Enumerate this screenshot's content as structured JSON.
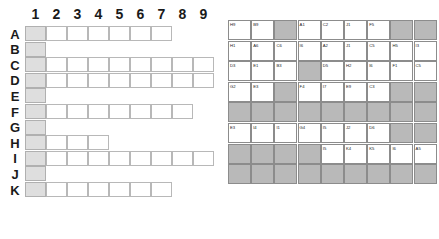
{
  "left_grid": {
    "name": "irregular-column-grid",
    "column_headers": [
      "1",
      "2",
      "3",
      "4",
      "5",
      "6",
      "7",
      "8",
      "9"
    ],
    "row_headers": [
      "A",
      "B",
      "C",
      "D",
      "E",
      "F",
      "G",
      "H",
      "I",
      "J",
      "K"
    ],
    "shaded_column": 1,
    "row_extents": {
      "A": 7,
      "B": 1,
      "C": 9,
      "D": 9,
      "E": 1,
      "F": 8,
      "G": 1,
      "H": 4,
      "I": 9,
      "J": 1,
      "K": 7
    },
    "colors": {
      "shaded_cell": "#dedede",
      "cell_border": "#b8b8b8",
      "header_text": "#1a1a1a"
    }
  },
  "right_table": {
    "name": "label-code-matrix",
    "columns": 9,
    "rows": 8,
    "colors": {
      "filled_cell": "#b9b9b9",
      "empty_cell": "#ffffff",
      "cell_border": "#8c8c8c",
      "label_text": "#222222"
    },
    "cells": [
      [
        "H9",
        "B9",
        "",
        "A1",
        "C2",
        "J1",
        "F5",
        "",
        ""
      ],
      [
        "H1",
        "A6",
        "C6",
        "I6",
        "A2",
        "J1",
        "C5",
        "H5",
        "I3",
        "A3"
      ],
      [
        "D3",
        "E1",
        "B3",
        "",
        "D5",
        "H2",
        "I6",
        "F1",
        "C5",
        "K2"
      ],
      [
        "G2",
        "E3",
        "",
        "F4",
        "I7",
        "E9",
        "C3",
        "",
        "",
        ""
      ],
      [
        "",
        "",
        "",
        "",
        "",
        "",
        "",
        "",
        ""
      ],
      [
        "E3",
        "I4",
        "I1",
        "G4",
        "I5",
        "J2",
        "D6",
        "",
        "",
        ""
      ],
      [
        "",
        "",
        "",
        "",
        "I5",
        "K4",
        "K5",
        "I6",
        "A5"
      ],
      [
        "",
        "",
        "",
        "",
        "",
        "",
        "",
        "",
        ""
      ]
    ],
    "rows_data": [
      {
        "index": 0,
        "cells": [
          "H9",
          "B9",
          "FILLED",
          "A1",
          "C2",
          "J1",
          "F5",
          "FILLED",
          "FILLED"
        ]
      },
      {
        "index": 1,
        "cells": [
          "H1",
          "A6",
          "C6",
          "I6",
          "A2",
          "J1",
          "C5",
          "H5",
          "I3"
        ]
      },
      {
        "index": 2,
        "cells": [
          "D3",
          "E1",
          "B3",
          "FILLED",
          "D5",
          "H2",
          "I6",
          "F1",
          "C5"
        ]
      },
      {
        "index": 3,
        "cells": [
          "G2",
          "E3",
          "FILLED",
          "F4",
          "I7",
          "E9",
          "C3",
          "FILLED",
          "FILLED"
        ]
      },
      {
        "index": 4,
        "cells": [
          "FILLED",
          "FILLED",
          "FILLED",
          "FILLED",
          "FILLED",
          "FILLED",
          "FILLED",
          "FILLED",
          "FILLED"
        ]
      },
      {
        "index": 5,
        "cells": [
          "E3",
          "I4",
          "I1",
          "G4",
          "I5",
          "J2",
          "D6",
          "FILLED",
          "FILLED"
        ]
      },
      {
        "index": 6,
        "cells": [
          "FILLED",
          "FILLED",
          "FILLED",
          "FILLED",
          "I5",
          "K4",
          "K5",
          "I6",
          "A5"
        ]
      },
      {
        "index": 7,
        "cells": [
          "FILLED",
          "FILLED",
          "FILLED",
          "FILLED",
          "FILLED",
          "FILLED",
          "FILLED",
          "FILLED",
          "FILLED"
        ]
      }
    ],
    "extra_column": {
      "row1": "A3",
      "row2": "K2"
    }
  }
}
